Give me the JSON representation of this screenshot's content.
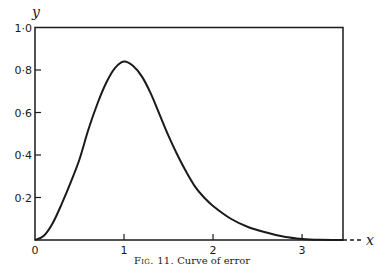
{
  "chart_data": {
    "type": "line",
    "title": "",
    "caption": "Fig. 11. Curve of error",
    "caption_parts": {
      "fig_label": "Fig. 11.",
      "text": "Curve of error"
    },
    "xlabel": "x",
    "ylabel": "y",
    "xlim": [
      0,
      3.46
    ],
    "ylim": [
      0,
      1.0
    ],
    "grid": false,
    "legend": null,
    "x_ticks": [
      {
        "value": 0,
        "label": "0"
      },
      {
        "value": 1,
        "label": "1"
      },
      {
        "value": 2,
        "label": "2"
      },
      {
        "value": 3,
        "label": "3"
      }
    ],
    "y_ticks": [
      {
        "value": 0.2,
        "label": "0·2"
      },
      {
        "value": 0.4,
        "label": "0·4"
      },
      {
        "value": 0.6,
        "label": "0·6"
      },
      {
        "value": 0.8,
        "label": "0·8"
      },
      {
        "value": 1.0,
        "label": "1·0"
      }
    ],
    "series": [
      {
        "name": "curve of error",
        "x": [
          0,
          0.1,
          0.2,
          0.3,
          0.4,
          0.5,
          0.6,
          0.7,
          0.8,
          0.9,
          1.0,
          1.1,
          1.2,
          1.3,
          1.4,
          1.5,
          1.6,
          1.7,
          1.8,
          1.9,
          2.0,
          2.2,
          2.4,
          2.6,
          2.8,
          3.0,
          3.2,
          3.46
        ],
        "y": [
          0,
          0.02,
          0.08,
          0.17,
          0.27,
          0.38,
          0.52,
          0.64,
          0.74,
          0.81,
          0.84,
          0.82,
          0.77,
          0.69,
          0.59,
          0.49,
          0.4,
          0.32,
          0.25,
          0.2,
          0.16,
          0.1,
          0.06,
          0.035,
          0.015,
          0.005,
          0.001,
          0
        ]
      }
    ],
    "annotations": [
      "x-axis extends beyond frame as dashed line"
    ]
  },
  "axes": {
    "x_var": "x",
    "y_var": "y"
  },
  "colors": {
    "ink": "#1a1a1a",
    "background": "#ffffff"
  }
}
